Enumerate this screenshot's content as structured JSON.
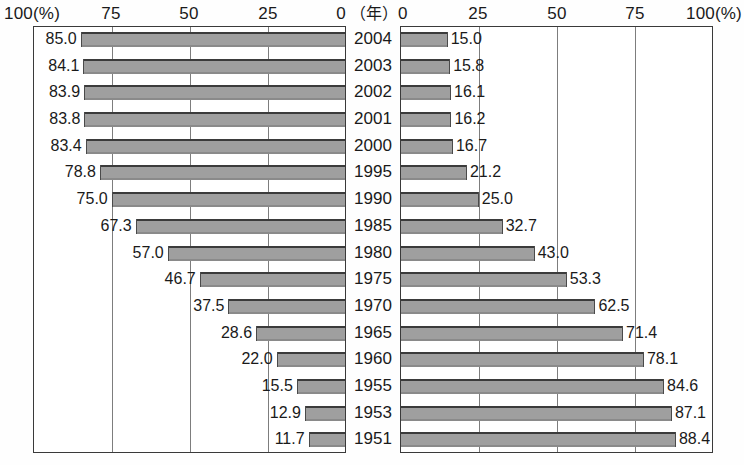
{
  "axis": {
    "left_ticks": [
      "100(%)",
      "75",
      "50",
      "25",
      "0"
    ],
    "right_ticks": [
      "0",
      "25",
      "50",
      "75",
      "100(%)"
    ],
    "year_header": "（年）"
  },
  "chart_data": {
    "type": "bar",
    "orientation": "horizontal",
    "layout": "back-to-back population pyramid style, two opposing horizontal bar panels sharing a central year axis",
    "title": "",
    "xlabel": "",
    "ylabel": "",
    "categories": [
      "2004",
      "2003",
      "2002",
      "2001",
      "2000",
      "1995",
      "1990",
      "1985",
      "1980",
      "1975",
      "1970",
      "1965",
      "1960",
      "1955",
      "1953",
      "1951"
    ],
    "series": [
      {
        "name": "left",
        "axis_side": "left",
        "axis_direction": "right-to-left",
        "xlim": [
          0,
          100
        ],
        "xticks": [
          100,
          75,
          50,
          25,
          0
        ],
        "unit": "%",
        "values": [
          85.0,
          84.1,
          83.9,
          83.8,
          83.4,
          78.8,
          75.0,
          67.3,
          57.0,
          46.7,
          37.5,
          28.6,
          22.0,
          15.5,
          12.9,
          11.7
        ],
        "labels": [
          "85.0",
          "84.1",
          "83.9",
          "83.8",
          "83.4",
          "78.8",
          "75.0",
          "67.3",
          "57.0",
          "46.7",
          "37.5",
          "28.6",
          "22.0",
          "15.5",
          "12.9",
          "11.7"
        ]
      },
      {
        "name": "right",
        "axis_side": "right",
        "axis_direction": "left-to-right",
        "xlim": [
          0,
          100
        ],
        "xticks": [
          0,
          25,
          50,
          75,
          100
        ],
        "unit": "%",
        "values": [
          15.0,
          15.8,
          16.1,
          16.2,
          16.7,
          21.2,
          25.0,
          32.7,
          43.0,
          53.3,
          62.5,
          71.4,
          78.1,
          84.6,
          87.1,
          88.4
        ],
        "labels": [
          "15.0",
          "15.8",
          "16.1",
          "16.2",
          "16.7",
          "21.2",
          "25.0",
          "32.7",
          "43.0",
          "53.3",
          "62.5",
          "71.4",
          "78.1",
          "84.6",
          "87.1",
          "88.4"
        ]
      }
    ],
    "grid": true,
    "gridlines_at": [
      25,
      50,
      75
    ],
    "legend": null,
    "colors": {
      "bar_fill": "#9f9f9f",
      "bar_edge": "#3b3b3b",
      "grid": "#7d7d7d",
      "frame": "#3a3a3a",
      "text": "#1a1a1a",
      "background": "#ffffff"
    }
  }
}
